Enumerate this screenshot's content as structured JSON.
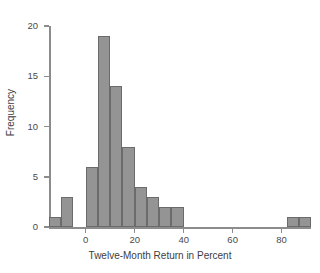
{
  "chart_data": {
    "type": "bar",
    "title": "",
    "xlabel": "Twelve-Month Return in Percent",
    "ylabel": "Frequency",
    "xlim": [
      -15,
      92
    ],
    "ylim": [
      0,
      20
    ],
    "grid": false,
    "legend": null,
    "bin_width": 5,
    "xticks": [
      0,
      20,
      40,
      60,
      80
    ],
    "xtick_labels": [
      "0",
      "20",
      "40",
      "60",
      "80"
    ],
    "yticks": [
      0,
      5,
      10,
      15,
      20
    ],
    "ytick_labels": [
      "0",
      "5",
      "10",
      "15",
      "20"
    ],
    "bin_starts": [
      -15,
      -10,
      -5,
      0,
      5,
      10,
      15,
      20,
      25,
      30,
      35,
      82,
      87
    ],
    "categories": [
      "-15 to -10",
      "-10 to -5",
      "-5 to 0",
      "0 to 5",
      "5 to 10",
      "10 to 15",
      "15 to 20",
      "20 to 25",
      "25 to 30",
      "30 to 35",
      "35 to 40",
      "82 to 87",
      "87 to 92"
    ],
    "values": [
      1,
      3,
      0,
      6,
      19,
      14,
      8,
      4,
      3,
      2,
      2,
      1,
      1
    ],
    "bar_fill_color": "#949494",
    "bar_edge_color": "#6b6b6b",
    "axis_color": "#8c8c8c",
    "background_color": "#ffffff"
  }
}
